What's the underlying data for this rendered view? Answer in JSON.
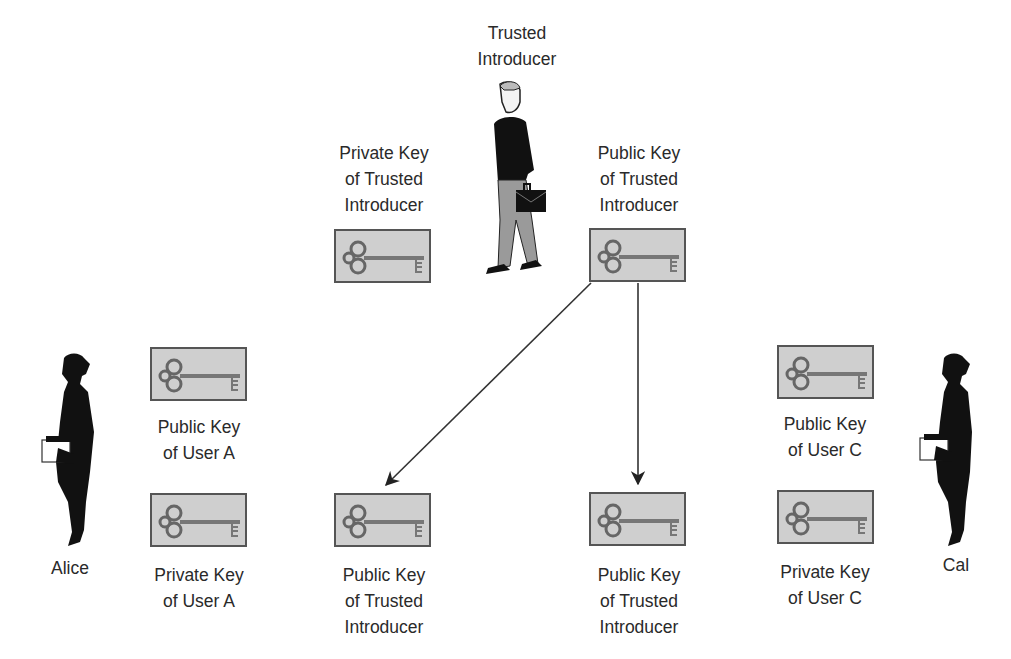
{
  "people": {
    "introducer": {
      "label_line1": "Trusted",
      "label_line2": "Introducer"
    },
    "alice": {
      "label": "Alice"
    },
    "cal": {
      "label": "Cal"
    }
  },
  "keys": [
    {
      "id": "ti-private",
      "line1": "Private Key",
      "line2": "of Trusted",
      "line3": "Introducer"
    },
    {
      "id": "ti-public",
      "line1": "Public Key",
      "line2": "of Trusted",
      "line3": "Introducer"
    },
    {
      "id": "a-public",
      "line1": "Public Key",
      "line2": "of User A"
    },
    {
      "id": "a-private",
      "line1": "Private Key",
      "line2": "of User A"
    },
    {
      "id": "ti-public-copy-a",
      "line1": "Public Key",
      "line2": "of Trusted",
      "line3": "Introducer"
    },
    {
      "id": "ti-public-copy-c",
      "line1": "Public Key",
      "line2": "of Trusted",
      "line3": "Introducer"
    },
    {
      "id": "c-public",
      "line1": "Public Key",
      "line2": "of User C"
    },
    {
      "id": "c-private",
      "line1": "Private Key",
      "line2": "of User C"
    }
  ],
  "colors": {
    "key_box": "#cfcfcf",
    "key_border": "#555555",
    "arrow": "#222222"
  }
}
